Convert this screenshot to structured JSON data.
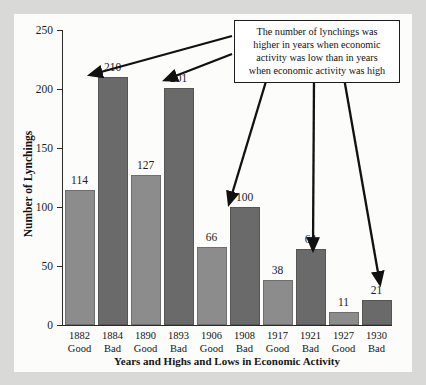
{
  "chart_data": {
    "type": "bar",
    "title": "",
    "xlabel": "Years and Highs and Lows in Economic Activity",
    "ylabel": "Number of Lynchings",
    "ylim": [
      0,
      250
    ],
    "yticks": [
      0,
      50,
      100,
      150,
      200,
      250
    ],
    "grid": false,
    "legend": "none",
    "categories": [
      "1882",
      "1884",
      "1890",
      "1893",
      "1906",
      "1908",
      "1917",
      "1921",
      "1927",
      "1930"
    ],
    "conditions": [
      "Good",
      "Bad",
      "Good",
      "Bad",
      "Good",
      "Bad",
      "Good",
      "Bad",
      "Good",
      "Bad"
    ],
    "values": [
      114,
      210,
      127,
      201,
      66,
      100,
      38,
      64,
      11,
      21
    ],
    "colors": {
      "good": "#8c8c8c",
      "bad": "#6a6a6a",
      "background": "#fcfcfb",
      "page": "#d9d9d7",
      "axis": "#2a2a2a",
      "text": "#141414"
    },
    "annotations": [
      {
        "text": "The number of lynchings was higher in years when economic activity was low than in years when economic activity was high",
        "points_to": [
          "1884",
          "1893",
          "1908",
          "1921",
          "1930"
        ]
      }
    ]
  },
  "callout": {
    "line1": "The number of lynchings was",
    "line2": "higher in years when economic",
    "line3": "activity was low than in years",
    "line4": "when economic activity was high"
  },
  "axes": {
    "y_title": "Number of Lynchings",
    "x_title": "Years and Highs and Lows in Economic Activity",
    "y_tick_0": "0",
    "y_tick_1": "50",
    "y_tick_2": "100",
    "y_tick_3": "150",
    "y_tick_4": "200",
    "y_tick_5": "250"
  },
  "bars": [
    {
      "year": "1882",
      "cond": "Good",
      "value": "114"
    },
    {
      "year": "1884",
      "cond": "Bad",
      "value": "210"
    },
    {
      "year": "1890",
      "cond": "Good",
      "value": "127"
    },
    {
      "year": "1893",
      "cond": "Bad",
      "value": "201"
    },
    {
      "year": "1906",
      "cond": "Good",
      "value": "66"
    },
    {
      "year": "1908",
      "cond": "Bad",
      "value": "100"
    },
    {
      "year": "1917",
      "cond": "Good",
      "value": "38"
    },
    {
      "year": "1921",
      "cond": "Bad",
      "value": "64"
    },
    {
      "year": "1927",
      "cond": "Good",
      "value": "11"
    },
    {
      "year": "1930",
      "cond": "Bad",
      "value": "21"
    }
  ]
}
